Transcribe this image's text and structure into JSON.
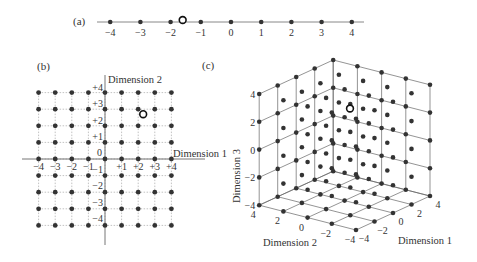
{
  "panels": {
    "a": {
      "label": "(a)",
      "ticks": [
        "−4",
        "−3",
        "−2",
        "−1",
        "0",
        "1",
        "2",
        "3",
        "4"
      ],
      "tick_values": [
        -4,
        -3,
        -2,
        -1,
        0,
        1,
        2,
        3,
        4
      ],
      "open_point": -1.6
    },
    "b": {
      "label": "(b)",
      "x_axis_label": "Dimension 1",
      "y_axis_label": "Dimension 2",
      "x_ticks": [
        "−4",
        "−3",
        "−2",
        "−1",
        "+1",
        "+2",
        "+3",
        "+4"
      ],
      "y_ticks_pos": [
        "+4",
        "+3",
        "+2",
        "+1"
      ],
      "zero_label": "0",
      "y_ticks_neg": [
        "−1",
        "−2",
        "−3",
        "−4"
      ],
      "grid_values": [
        -4,
        -3,
        -2,
        -1,
        0,
        1,
        2,
        3,
        4
      ],
      "open_point": [
        2.3,
        2.7
      ]
    },
    "c": {
      "label": "(c)",
      "z_axis_label": "Dimension 3",
      "x_axis_label": "Dimension 1",
      "y_axis_label": "Dimension 2",
      "z_ticks": [
        "4",
        "2",
        "0",
        "−2",
        "−4"
      ],
      "d2_ticks": [
        "4",
        "2",
        "0",
        "−2",
        "−4"
      ],
      "d1_ticks": [
        "−4",
        "−2",
        "0",
        "2",
        "4"
      ],
      "grid_values": [
        -4,
        -2,
        0,
        2,
        4
      ],
      "open_point": [
        3.2,
        2,
        1.2
      ]
    }
  },
  "colors": {
    "dot": "#333333",
    "grid": "#999999",
    "axis": "#777777"
  }
}
